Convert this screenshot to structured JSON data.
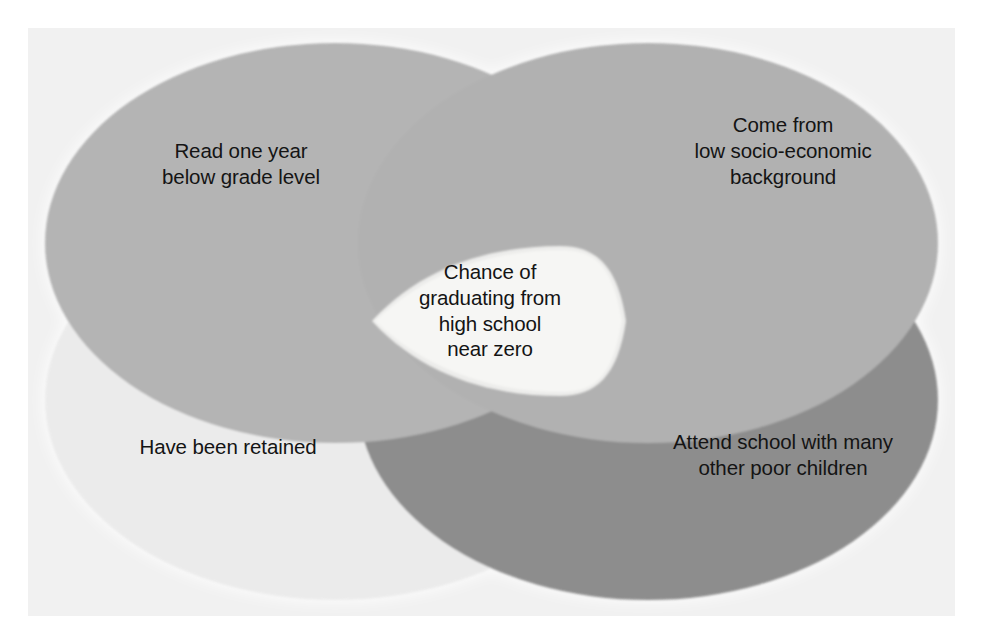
{
  "diagram": {
    "type": "venn",
    "set_count": 4,
    "title": "",
    "background_color": "#f1f1f1",
    "page_color": "#ffffff",
    "text_color": "#141414",
    "center_fill": "#f5f5f3",
    "halo_color": "#ffffff",
    "sets": [
      {
        "id": "top-left",
        "label": "Read one year\nbelow grade level",
        "fill": "#a6a6a6",
        "position": "top-left"
      },
      {
        "id": "top-right",
        "label": "Come from\nlow socio-economic\nbackground",
        "fill": "#a3a3a3",
        "position": "top-right"
      },
      {
        "id": "bottom-left",
        "label": "Have been retained",
        "fill": "#ebebeb",
        "position": "bottom-left"
      },
      {
        "id": "bottom-right",
        "label": "Attend school with many\nother poor children",
        "fill": "#8a8a8a",
        "position": "bottom-right"
      }
    ],
    "intersection": {
      "id": "center",
      "label": "Chance of\ngraduating from\nhigh school\nnear zero",
      "fill": "#f5f5f3"
    }
  }
}
